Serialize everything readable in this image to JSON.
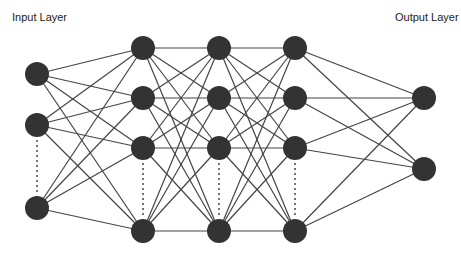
{
  "labels": {
    "input": "Input Layer",
    "output": "Output Layer"
  },
  "style": {
    "node_color": "#333333",
    "edge_color": "#444444",
    "node_radius": 12
  },
  "layers": [
    {
      "name": "input",
      "x": 37,
      "nodes": [
        74,
        125,
        208
      ],
      "ellipsis_between": [
        1,
        2
      ]
    },
    {
      "name": "hidden-1",
      "x": 143,
      "nodes": [
        48,
        98,
        148,
        231
      ],
      "ellipsis_between": [
        2,
        3
      ]
    },
    {
      "name": "hidden-2",
      "x": 219,
      "nodes": [
        48,
        98,
        148,
        231
      ],
      "ellipsis_between": [
        2,
        3
      ]
    },
    {
      "name": "hidden-3",
      "x": 295,
      "nodes": [
        48,
        98,
        148,
        231
      ],
      "ellipsis_between": [
        2,
        3
      ]
    },
    {
      "name": "output",
      "x": 424,
      "nodes": [
        98,
        169
      ],
      "ellipsis_between": null
    }
  ]
}
